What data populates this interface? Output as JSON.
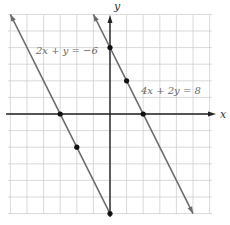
{
  "chart_data": {
    "type": "line",
    "title": "",
    "xlabel": "x",
    "ylabel": "y",
    "xlim": [
      -6,
      6
    ],
    "ylim": [
      -6,
      6
    ],
    "grid": true,
    "series": [
      {
        "name": "2x + y = -6",
        "equation": "2x + y = −6",
        "slope": -2,
        "intercept": -6,
        "marked_points": [
          [
            -3,
            0
          ],
          [
            -2,
            -2
          ],
          [
            0,
            -6
          ]
        ]
      },
      {
        "name": "4x + 2y = 8",
        "equation": "4x + 2y = 8",
        "slope": -2,
        "intercept": 4,
        "marked_points": [
          [
            0,
            4
          ],
          [
            1,
            2
          ],
          [
            2,
            0
          ]
        ]
      }
    ]
  },
  "labels": {
    "x_axis": "x",
    "y_axis": "y",
    "line1": "2x + y = −6",
    "line2": "4x + 2y = 8"
  },
  "colors": {
    "grid": "#cfcfcf",
    "axis": "#222222",
    "line": "#6a6a6a",
    "point": "#111111"
  }
}
